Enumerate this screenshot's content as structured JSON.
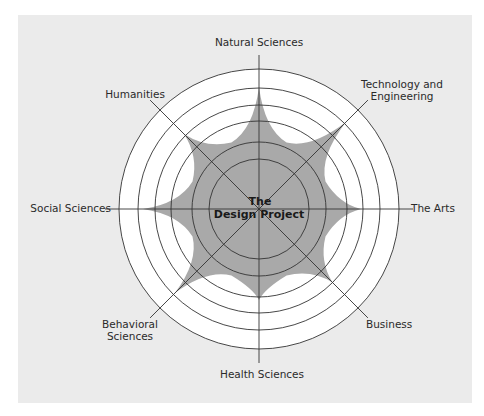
{
  "diagram": {
    "title_line1": "The",
    "title_line2": "Design Project",
    "center": {
      "x": 259,
      "y": 209
    },
    "ring_radii": [
      140,
      121,
      104,
      88,
      67,
      50
    ],
    "axis_length": 154,
    "colors": {
      "panel": "#ebebeb",
      "ring_fill": "#ffffff",
      "star_fill": "#a9a9a9",
      "line": "#333333",
      "text": "#2a2a2a"
    },
    "star_valley_radius": 72,
    "axes": [
      {
        "id": "natural-sciences",
        "label_lines": [
          "Natural Sciences"
        ],
        "angle_deg": -90,
        "spike_radius": 122,
        "label_x": 259,
        "label_y": 46,
        "anchor": "middle"
      },
      {
        "id": "technology-engineering",
        "label_lines": [
          "Technology and",
          "Engineering"
        ],
        "angle_deg": -45,
        "spike_radius": 123,
        "label_x": 402,
        "label_y": 88,
        "anchor": "middle"
      },
      {
        "id": "the-arts",
        "label_lines": [
          "The Arts"
        ],
        "angle_deg": 0,
        "spike_radius": 102,
        "label_x": 411,
        "label_y": 212,
        "anchor": "start"
      },
      {
        "id": "business",
        "label_lines": [
          "Business"
        ],
        "angle_deg": 45,
        "spike_radius": 104,
        "label_x": 366,
        "label_y": 328,
        "anchor": "start"
      },
      {
        "id": "health-sciences",
        "label_lines": [
          "Health Sciences"
        ],
        "angle_deg": 90,
        "spike_radius": 91,
        "label_x": 262,
        "label_y": 378,
        "anchor": "middle"
      },
      {
        "id": "behavioral-sciences",
        "label_lines": [
          "Behavioral",
          "Sciences"
        ],
        "angle_deg": 135,
        "spike_radius": 119,
        "label_x": 130,
        "label_y": 328,
        "anchor": "middle"
      },
      {
        "id": "social-sciences",
        "label_lines": [
          "Social Sciences"
        ],
        "angle_deg": 180,
        "spike_radius": 116,
        "label_x": 111,
        "label_y": 212,
        "anchor": "end"
      },
      {
        "id": "humanities",
        "label_lines": [
          "Humanities"
        ],
        "angle_deg": -135,
        "spike_radius": 106,
        "label_x": 135,
        "label_y": 98,
        "anchor": "middle"
      }
    ]
  }
}
